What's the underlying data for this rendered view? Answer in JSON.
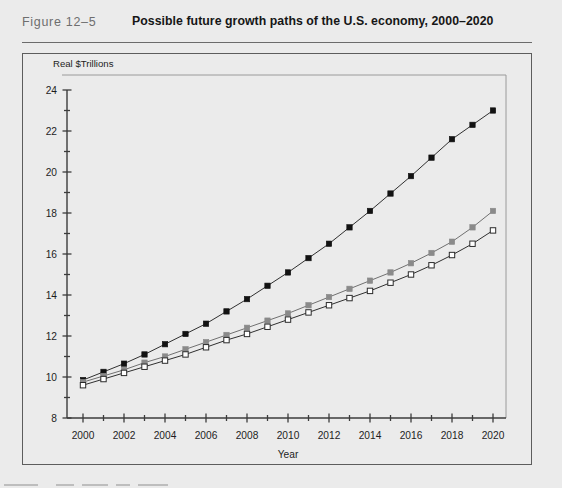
{
  "figure": {
    "number_label": "Figure 12–5",
    "title": "Possible future growth paths of the U.S. economy, 2000–2020"
  },
  "colors": {
    "page_background": "#ebebeb",
    "panel_border": "#5d5d5d",
    "axis": "#3c3c3c",
    "series_high": "#121212",
    "series_mid": "#8a8a8a",
    "series_low": "#ffffff",
    "series_low_outline": "#2b2b2b",
    "rule": "#6b6b6b",
    "figure_number_text": "#6e6e6e",
    "title_text": "#161616"
  },
  "chart_data": {
    "type": "line",
    "title": "Possible future growth paths of the U.S. economy, 2000–2020",
    "xlabel": "Year",
    "ylabel": "Real $Trillions",
    "xlim": [
      2000,
      2020
    ],
    "ylim": [
      8,
      24
    ],
    "y_major_step": 2,
    "y_minor_step": 1,
    "x_major_step": 2,
    "x_minor_step": 1,
    "grid": false,
    "legend": "none",
    "y_tick_labels": [
      "8",
      "10",
      "12",
      "14",
      "16",
      "18",
      "20",
      "22",
      "24"
    ],
    "x_tick_labels": [
      "2000",
      "2002",
      "2004",
      "2006",
      "2008",
      "2010",
      "2012",
      "2014",
      "2016",
      "2018",
      "2020"
    ],
    "x": [
      2000,
      2001,
      2002,
      2003,
      2004,
      2005,
      2006,
      2007,
      2008,
      2009,
      2010,
      2011,
      2012,
      2013,
      2014,
      2015,
      2016,
      2017,
      2018,
      2019,
      2020
    ],
    "series": [
      {
        "name": "High growth path",
        "marker": "filled-square",
        "color": "#121212",
        "values": [
          9.85,
          10.25,
          10.65,
          11.1,
          11.6,
          12.1,
          12.6,
          13.2,
          13.8,
          14.45,
          15.1,
          15.8,
          16.5,
          17.3,
          18.1,
          18.95,
          19.8,
          20.7,
          21.6,
          22.3,
          23.0
        ]
      },
      {
        "name": "Medium growth path",
        "marker": "filled-square-gray",
        "color": "#8a8a8a",
        "values": [
          9.75,
          10.05,
          10.35,
          10.7,
          11.0,
          11.35,
          11.7,
          12.05,
          12.4,
          12.75,
          13.1,
          13.5,
          13.9,
          14.3,
          14.7,
          15.1,
          15.55,
          16.05,
          16.6,
          17.3,
          18.1
        ]
      },
      {
        "name": "Low growth path",
        "marker": "open-square",
        "color": "#ffffff",
        "values": [
          9.6,
          9.9,
          10.2,
          10.5,
          10.8,
          11.1,
          11.45,
          11.8,
          12.1,
          12.45,
          12.8,
          13.15,
          13.5,
          13.85,
          14.2,
          14.6,
          15.0,
          15.45,
          15.95,
          16.5,
          17.15
        ]
      }
    ]
  }
}
